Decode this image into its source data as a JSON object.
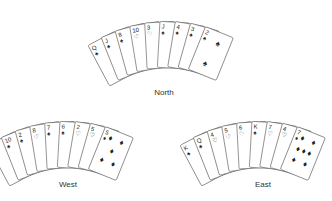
{
  "hands": [
    {
      "name": "North",
      "cards": [
        {
          "rank": "Q",
          "suit": "spade"
        },
        {
          "rank": "J",
          "suit": "spade"
        },
        {
          "rank": "8",
          "suit": "spade"
        },
        {
          "rank": "10",
          "suit": "heart"
        },
        {
          "rank": "3",
          "suit": "heart"
        },
        {
          "rank": "J",
          "suit": "spade"
        },
        {
          "rank": "4",
          "suit": "spade"
        },
        {
          "rank": "3",
          "suit": "spade"
        },
        {
          "rank": "2",
          "suit": "spade"
        }
      ]
    },
    {
      "name": "West",
      "cards": [
        {
          "rank": "A",
          "suit": "spade"
        },
        {
          "rank": "10",
          "suit": "spade"
        },
        {
          "rank": "2",
          "suit": "spade"
        },
        {
          "rank": "8",
          "suit": "heart"
        },
        {
          "rank": "7",
          "suit": "spade"
        },
        {
          "rank": "6",
          "suit": "spade"
        },
        {
          "rank": "2",
          "suit": "heart"
        },
        {
          "rank": "5",
          "suit": "heart"
        },
        {
          "rank": "5",
          "suit": "diamond"
        }
      ]
    },
    {
      "name": "East",
      "cards": [
        {
          "rank": "K",
          "suit": "spade"
        },
        {
          "rank": "Q",
          "suit": "spade"
        },
        {
          "rank": "4",
          "suit": "heart"
        },
        {
          "rank": "5",
          "suit": "heart"
        },
        {
          "rank": "6",
          "suit": "heart"
        },
        {
          "rank": "K",
          "suit": "spade"
        },
        {
          "rank": "7",
          "suit": "heart"
        },
        {
          "rank": "4",
          "suit": "heart"
        },
        {
          "rank": "7",
          "suit": "diamond"
        }
      ]
    }
  ],
  "labels": {
    "north": "North",
    "west": "West",
    "east": "East"
  }
}
